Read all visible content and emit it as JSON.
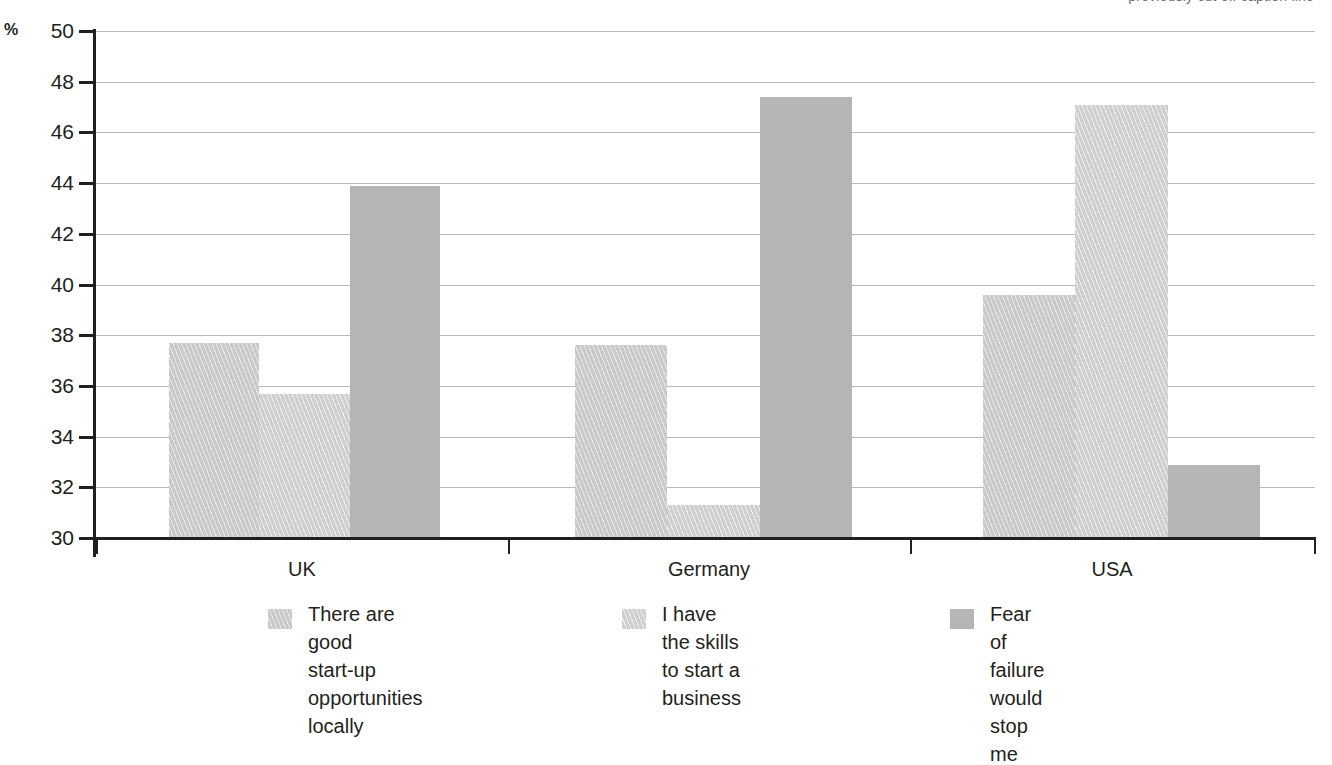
{
  "top_caption": "previously cut off caption line",
  "chart_data": {
    "type": "bar",
    "title": "",
    "xlabel": "",
    "ylabel": "%",
    "ylim": [
      30,
      50
    ],
    "yticks": [
      30,
      32,
      34,
      36,
      38,
      40,
      42,
      44,
      46,
      48,
      50
    ],
    "ytick_labels": [
      "30",
      "32",
      "34",
      "36",
      "38",
      "40",
      "42",
      "44",
      "46",
      "48",
      "50"
    ],
    "grid": true,
    "legend_position": "bottom",
    "categories": [
      "UK",
      "Germany",
      "USA"
    ],
    "series": [
      {
        "name": "There are good\nstart-up\nopportunities locally",
        "color": "#c9c9c9",
        "pattern": "diagonal-hatch",
        "values": [
          37.7,
          37.6,
          39.6
        ]
      },
      {
        "name": "I have the skills\nto start a business",
        "color": "#cfcfcf",
        "pattern": "diagonal-hatch-light",
        "values": [
          35.7,
          31.3,
          47.1
        ]
      },
      {
        "name": "Fear of failure\nwould stop me",
        "color": "#b5b5b5",
        "pattern": "solid",
        "values": [
          43.9,
          47.4,
          32.9
        ]
      }
    ]
  },
  "axis": {
    "unit_label": "%"
  },
  "colors": {
    "axis": "#231f20",
    "grid": "#b9b9b9",
    "series_1": "#c9c9c9",
    "series_2": "#cfcfcf",
    "series_3": "#b5b5b5"
  }
}
